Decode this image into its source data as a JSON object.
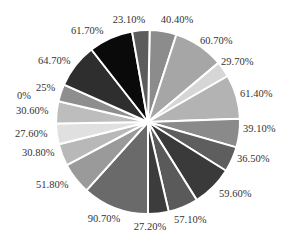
{
  "chart_data": {
    "type": "pie",
    "title": "",
    "center": [
      148,
      122
    ],
    "radius": 92,
    "slices": [
      {
        "label": "40.40%",
        "value": 40.4,
        "start": 1,
        "end": 18,
        "color": "#8c8c8c",
        "lx": 177,
        "ly": 23,
        "anchor": "middle"
      },
      {
        "label": "60.70%",
        "value": 60.7,
        "start": 18,
        "end": 50,
        "color": "#a6a6a6",
        "lx": 200,
        "ly": 44,
        "anchor": "start"
      },
      {
        "label": "29.70%",
        "value": 29.7,
        "start": 50,
        "end": 60,
        "color": "#d6d6d6",
        "lx": 221,
        "ly": 65,
        "anchor": "start"
      },
      {
        "label": "61.40%",
        "value": 61.4,
        "start": 60,
        "end": 88,
        "color": "#b3b3b3",
        "lx": 240,
        "ly": 97,
        "anchor": "start"
      },
      {
        "label": "39.10%",
        "value": 39.1,
        "start": 88,
        "end": 106,
        "color": "#8a8a8a",
        "lx": 243,
        "ly": 132,
        "anchor": "start"
      },
      {
        "label": "36.50%",
        "value": 36.5,
        "start": 106,
        "end": 122,
        "color": "#5e5e5e",
        "lx": 237,
        "ly": 162,
        "anchor": "start"
      },
      {
        "label": "59.60%",
        "value": 59.6,
        "start": 122,
        "end": 148,
        "color": "#3a3a3a",
        "lx": 219,
        "ly": 197,
        "anchor": "start"
      },
      {
        "label": "57.10%",
        "value": 57.1,
        "start": 148,
        "end": 167,
        "color": "#5a5a5a",
        "lx": 174,
        "ly": 223,
        "anchor": "start"
      },
      {
        "label": "27.20%",
        "value": 27.2,
        "start": 167,
        "end": 180,
        "color": "#3c3c3c",
        "lx": 150,
        "ly": 230,
        "anchor": "middle"
      },
      {
        "label": "90.70%",
        "value": 90.7,
        "start": 180,
        "end": 222,
        "color": "#6a6a6a",
        "lx": 104,
        "ly": 222,
        "anchor": "middle"
      },
      {
        "label": "51.80%",
        "value": 51.8,
        "start": 222,
        "end": 242,
        "color": "#9a9a9a",
        "lx": 36,
        "ly": 188,
        "anchor": "start"
      },
      {
        "label": "30.80%",
        "value": 30.8,
        "start": 242,
        "end": 256,
        "color": "#b8b8b8",
        "lx": 22,
        "ly": 156,
        "anchor": "start"
      },
      {
        "label": "27.60%",
        "value": 27.6,
        "start": 256,
        "end": 269,
        "color": "#e0e0e0",
        "lx": 15,
        "ly": 137,
        "anchor": "start"
      },
      {
        "label": "30.60%",
        "value": 30.6,
        "start": 269,
        "end": 283,
        "color": "#bdbdbd",
        "lx": 16,
        "ly": 114,
        "anchor": "start"
      },
      {
        "label": "0%",
        "value": 0,
        "start": 283,
        "end": 283,
        "color": "#9a9a9a",
        "lx": 17,
        "ly": 99,
        "anchor": "start"
      },
      {
        "label": "25%",
        "value": 25,
        "start": 283,
        "end": 294,
        "color": "#8e8e8e",
        "lx": 36,
        "ly": 91,
        "anchor": "start"
      },
      {
        "label": "64.70%",
        "value": 64.7,
        "start": 294,
        "end": 322,
        "color": "#2e2e2e",
        "lx": 38,
        "ly": 64,
        "anchor": "start"
      },
      {
        "label": "61.70%",
        "value": 61.7,
        "start": 322,
        "end": 350,
        "color": "#0a0a0a",
        "lx": 71,
        "ly": 34,
        "anchor": "start"
      },
      {
        "label": "23.10%",
        "value": 23.1,
        "start": 350,
        "end": 361,
        "color": "#5c5c5c",
        "lx": 129,
        "ly": 23,
        "anchor": "middle"
      }
    ],
    "legend": null,
    "grid": false
  }
}
